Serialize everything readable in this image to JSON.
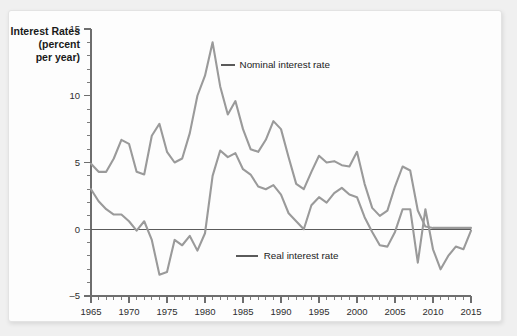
{
  "chart_data": {
    "type": "line",
    "title": "",
    "ylabel_lines": [
      "Interest Rates",
      "(percent",
      "per year)"
    ],
    "xlabel": "",
    "ylabel": "Interest Rates (percent per year)",
    "xlim": [
      1965,
      2015
    ],
    "ylim": [
      -5,
      15
    ],
    "y_ticks": [
      -5,
      0,
      5,
      10,
      15
    ],
    "x_ticks": [
      1965,
      1970,
      1975,
      1980,
      1985,
      1990,
      1995,
      2000,
      2005,
      2010,
      2015
    ],
    "x_minor_step": 1,
    "y_minor_step": 1,
    "grid": false,
    "zero_line": true,
    "legend_position": "inline-annotation",
    "line_color": "#9a9a9a",
    "axis_color": "#6e6e6e",
    "x": [
      1965,
      1966,
      1967,
      1968,
      1969,
      1970,
      1971,
      1972,
      1973,
      1974,
      1975,
      1976,
      1977,
      1978,
      1979,
      1980,
      1981,
      1982,
      1983,
      1984,
      1985,
      1986,
      1987,
      1988,
      1989,
      1990,
      1991,
      1992,
      1993,
      1994,
      1995,
      1996,
      1997,
      1998,
      1999,
      2000,
      2001,
      2002,
      2003,
      2004,
      2005,
      2006,
      2007,
      2008,
      2009,
      2010,
      2011,
      2012,
      2013,
      2014,
      2015
    ],
    "series": [
      {
        "name": "Nominal interest rate",
        "color": "#9a9a9a",
        "annotation": "Nominal interest rate",
        "values": [
          4.9,
          4.3,
          4.3,
          5.3,
          6.7,
          6.4,
          4.3,
          4.1,
          7.0,
          7.9,
          5.8,
          5.0,
          5.3,
          7.2,
          10.0,
          11.5,
          14.0,
          10.7,
          8.6,
          9.6,
          7.5,
          6.0,
          5.8,
          6.7,
          8.1,
          7.5,
          5.4,
          3.4,
          3.0,
          4.3,
          5.5,
          5.0,
          5.1,
          4.8,
          4.7,
          5.8,
          3.4,
          1.6,
          1.0,
          1.4,
          3.2,
          4.7,
          4.4,
          1.4,
          0.2,
          0.1,
          0.1,
          0.1,
          0.1,
          0.1,
          0.1
        ]
      },
      {
        "name": "Real interest rate",
        "color": "#9a9a9a",
        "annotation": "Real interest rate",
        "values": [
          3.0,
          2.1,
          1.5,
          1.1,
          1.1,
          0.6,
          -0.1,
          0.6,
          -0.8,
          -3.4,
          -3.2,
          -0.8,
          -1.2,
          -0.5,
          -1.6,
          -0.3,
          4.0,
          5.9,
          5.4,
          5.7,
          4.5,
          4.1,
          3.2,
          3.0,
          3.3,
          2.6,
          1.2,
          0.6,
          0.0,
          1.8,
          2.4,
          2.0,
          2.7,
          3.1,
          2.6,
          2.4,
          0.9,
          -0.2,
          -1.2,
          -1.3,
          -0.2,
          1.5,
          1.5,
          -2.5,
          1.5,
          -1.5,
          -3.0,
          -2.0,
          -1.3,
          -1.5,
          -0.1
        ]
      }
    ],
    "annotations": [
      {
        "text": "Nominal interest rate",
        "x_anchor": 1981,
        "y_anchor": 12.3
      },
      {
        "text": "Real interest rate",
        "x_anchor": 1983,
        "y_anchor": -2.0
      }
    ]
  }
}
